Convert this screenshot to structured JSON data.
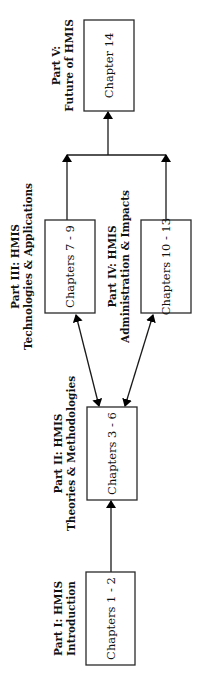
{
  "diagram": {
    "orientation": "rotated -90 degrees (text reads bottom-to-top)",
    "nodes": [
      {
        "id": "part1",
        "box_label": "Chapters 1 - 2",
        "title_line1": "Part I: HMIS",
        "title_line2": "Introduction"
      },
      {
        "id": "part2",
        "box_label": "Chapters 3 - 6",
        "title_line1": "Part II: HMIS",
        "title_line2": "Theories & Methodologies"
      },
      {
        "id": "part3",
        "box_label": "Chapters  7 - 9",
        "title_line1": "Part III: HMIS",
        "title_line2": "Technologies & Applications"
      },
      {
        "id": "part4",
        "box_label": "Chapters 10 - 13",
        "title_line1": "Part IV: HMIS",
        "title_line2": "Administration & Impacts"
      },
      {
        "id": "part5",
        "box_label": "Chapter 14",
        "title_line1": "Part V:",
        "title_line2": "Future of HMIS"
      }
    ],
    "edges": [
      {
        "from": "part1",
        "to": "part2",
        "type": "arrow"
      },
      {
        "from": "part2",
        "to": "part3",
        "type": "double-arrow"
      },
      {
        "from": "part2",
        "to": "part4",
        "type": "double-arrow"
      },
      {
        "from": "part3",
        "to": "part5",
        "type": "arrow-merge"
      },
      {
        "from": "part4",
        "to": "part5",
        "type": "arrow-merge"
      }
    ],
    "colors": {
      "stroke": "#1a1a1a",
      "background": "#ffffff",
      "text": "#111111"
    }
  }
}
